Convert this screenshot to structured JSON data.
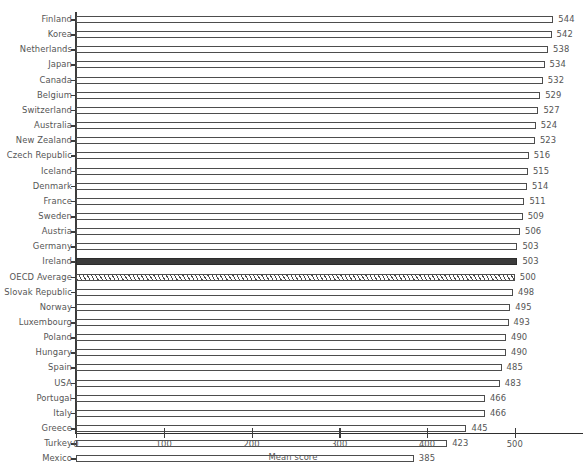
{
  "chart_data": {
    "type": "bar",
    "orientation": "horizontal",
    "title": "",
    "xlabel": "Mean score",
    "ylabel": "",
    "xlim": [
      0,
      578
    ],
    "xticks": [
      0,
      100,
      200,
      300,
      400,
      500
    ],
    "xtick_labels": [
      "0",
      "100",
      "200",
      "300",
      "400",
      "500"
    ],
    "grid": false,
    "legend": null,
    "categories": [
      "Finland",
      "Korea",
      "Netherlands",
      "Japan",
      "Canada",
      "Belgium",
      "Switzerland",
      "Australia",
      "New Zealand",
      "Czech Republic",
      "Iceland",
      "Denmark",
      "France",
      "Sweden",
      "Austria",
      "Germany",
      "Ireland",
      "OECD Average",
      "Slovak Republic",
      "Norway",
      "Luxembourg",
      "Poland",
      "Hungary",
      "Spain",
      "USA",
      "Portugal",
      "Italy",
      "Greece",
      "Turkey",
      "Mexico"
    ],
    "values": [
      544,
      542,
      538,
      534,
      532,
      529,
      527,
      524,
      523,
      516,
      515,
      514,
      511,
      509,
      506,
      503,
      503,
      500,
      498,
      495,
      493,
      490,
      490,
      485,
      483,
      466,
      466,
      445,
      423,
      385
    ],
    "bar_styles": [
      "open",
      "open",
      "open",
      "open",
      "open",
      "open",
      "open",
      "open",
      "open",
      "open",
      "open",
      "open",
      "open",
      "open",
      "open",
      "open",
      "filled",
      "hatched",
      "open",
      "open",
      "open",
      "open",
      "open",
      "open",
      "open",
      "open",
      "open",
      "open",
      "open",
      "open"
    ],
    "colors": {
      "bar_edge": "#4d4d4d",
      "bar_face": "#ffffff",
      "highlight_face": "#3b3b3b",
      "axis": "#2e2e2e",
      "text": "#555555"
    }
  }
}
